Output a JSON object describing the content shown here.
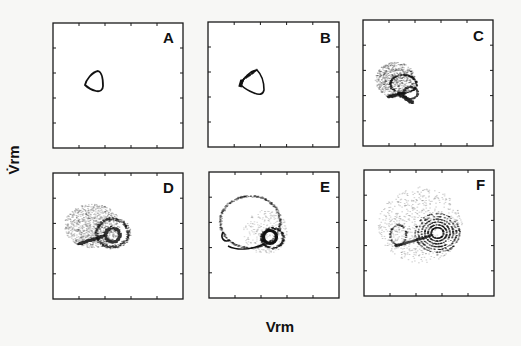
{
  "figure": {
    "layout": "2x3 grid of phase-plane panels",
    "x_axis_label": "Vrm",
    "y_axis_label": "V̇rm",
    "background": "#f7f7f5",
    "ink_color": "#111111"
  },
  "chart_data": {
    "type": "scatter",
    "title": "",
    "xlabel": "Vrm",
    "ylabel": "V̇rm (time derivative of Vrm)",
    "shared_axes": true,
    "ticks_per_axis": 4,
    "tick_labels": [],
    "grid": false,
    "legend": null,
    "panels": [
      {
        "label": "A",
        "description": "single closed limit cycle (period-1 orbit), small rounded-triangular loop",
        "center": [
          0.36,
          0.45
        ],
        "extent": [
          0.14,
          0.2
        ],
        "density": "line"
      },
      {
        "label": "B",
        "description": "closed loop with thickening on left edge, onset of band/period-doubling",
        "center": [
          0.41,
          0.46
        ],
        "extent": [
          0.2,
          0.26
        ],
        "density": "thin band"
      },
      {
        "label": "C",
        "description": "chaotic band attractor with dense lower branch and hollow right lobe",
        "center": [
          0.33,
          0.47
        ],
        "extent": [
          0.38,
          0.34
        ],
        "density": "dense scatter"
      },
      {
        "label": "D",
        "description": "enlarged chaotic attractor with dense spiral core near right lobe",
        "center": [
          0.36,
          0.5
        ],
        "extent": [
          0.5,
          0.44
        ],
        "density": "dense scatter"
      },
      {
        "label": "E",
        "description": "large sparse outer loop with hook on left and dark ring core",
        "center": [
          0.42,
          0.5
        ],
        "extent": [
          0.6,
          0.52
        ],
        "density": "sparse loop + ring"
      },
      {
        "label": "F",
        "description": "diffuse attractor with concentric spiral rings and sparse outer cloud",
        "center": [
          0.45,
          0.48
        ],
        "extent": [
          0.7,
          0.66
        ],
        "density": "diffuse scatter"
      }
    ]
  },
  "panels": [
    {
      "id": "A",
      "label": "A",
      "x": 53,
      "y": 23,
      "w": 130,
      "h": 125
    },
    {
      "id": "B",
      "label": "B",
      "x": 208,
      "y": 22,
      "w": 131,
      "h": 125
    },
    {
      "id": "C",
      "label": "C",
      "x": 363,
      "y": 20,
      "w": 130,
      "h": 126
    },
    {
      "id": "D",
      "label": "D",
      "x": 53,
      "y": 173,
      "w": 130,
      "h": 126
    },
    {
      "id": "E",
      "label": "E",
      "x": 209,
      "y": 172,
      "w": 130,
      "h": 126
    },
    {
      "id": "F",
      "label": "F",
      "x": 364,
      "y": 170,
      "w": 130,
      "h": 126
    }
  ]
}
